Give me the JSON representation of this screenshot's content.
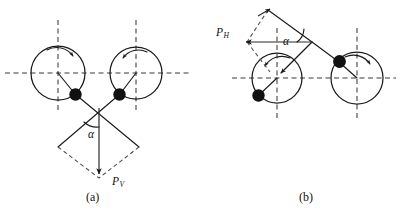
{
  "figure": {
    "background_color": "#ffffff",
    "line_color": "#1a1a1a",
    "dash_color": "#3a3a3a",
    "mass_color": "#111111",
    "width": 401,
    "height": 214
  },
  "panels": [
    {
      "id": "a",
      "caption": "(a)",
      "force_label": "P",
      "force_subscript": "V",
      "angle_label": "α",
      "force_direction": "vertical-down",
      "rotors": [
        {
          "name": "left-rotor",
          "cx": 58,
          "cy": 73,
          "r": 27,
          "mass_angle_deg": -52,
          "rotation": "clockwise"
        },
        {
          "name": "right-rotor",
          "cx": 136,
          "cy": 73,
          "r": 26,
          "mass_angle_deg": -128,
          "rotation": "counter-clockwise"
        }
      ]
    },
    {
      "id": "b",
      "caption": "(b)",
      "force_label": "P",
      "force_subscript": "H",
      "angle_label": "α",
      "force_direction": "horizontal-left",
      "rotors": [
        {
          "name": "left-rotor",
          "cx": 277,
          "cy": 78,
          "r": 25,
          "mass_angle_deg": -139,
          "rotation": "counter-clockwise"
        },
        {
          "name": "right-rotor",
          "cx": 357,
          "cy": 78,
          "r": 26,
          "mass_angle_deg": 139,
          "rotation": "clockwise"
        }
      ]
    }
  ]
}
